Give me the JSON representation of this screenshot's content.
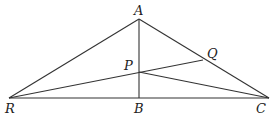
{
  "diagram": {
    "points": {
      "A": {
        "label": "A",
        "x": 139,
        "y": 19
      },
      "B": {
        "label": "B",
        "x": 139,
        "y": 98
      },
      "C": {
        "label": "C",
        "x": 269,
        "y": 98
      },
      "R": {
        "label": "R",
        "x": 9,
        "y": 98
      },
      "P": {
        "label": "P",
        "x": 139,
        "y": 72
      },
      "Q": {
        "label": "Q",
        "x": 203,
        "y": 60
      }
    },
    "segments": [
      "RA",
      "AC",
      "RC",
      "AB",
      "RQ",
      "PC"
    ],
    "colors": {
      "stroke": "#333333",
      "background": "#ffffff"
    }
  }
}
